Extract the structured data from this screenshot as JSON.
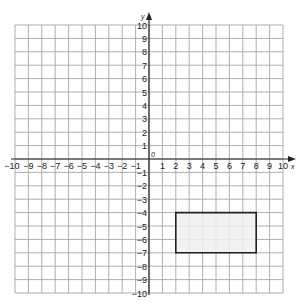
{
  "chart_data": {
    "type": "coordinate-grid",
    "title": "",
    "xlabel": "x",
    "ylabel": "y",
    "origin_label": "0",
    "xlim": [
      -10,
      10
    ],
    "ylim": [
      -10,
      10
    ],
    "grid": true,
    "x_ticks": [
      -10,
      -9,
      -8,
      -7,
      -6,
      -5,
      -4,
      -3,
      -2,
      -1,
      1,
      2,
      3,
      4,
      5,
      6,
      7,
      8,
      9,
      10
    ],
    "y_ticks": [
      -10,
      -9,
      -8,
      -7,
      -6,
      -5,
      -4,
      -3,
      -2,
      -1,
      1,
      2,
      3,
      4,
      5,
      6,
      7,
      8,
      9,
      10
    ],
    "shapes": [
      {
        "name": "rectangle",
        "vertices": [
          [
            2,
            -4
          ],
          [
            8,
            -4
          ],
          [
            8,
            -7
          ],
          [
            2,
            -7
          ]
        ],
        "fill": "#f0f0f0",
        "stroke": "#222222"
      }
    ]
  },
  "colors": {
    "grid": "#9a9a9a",
    "axis": "#222222",
    "shape_fill": "#f0f0f0",
    "shape_stroke": "#222222"
  }
}
